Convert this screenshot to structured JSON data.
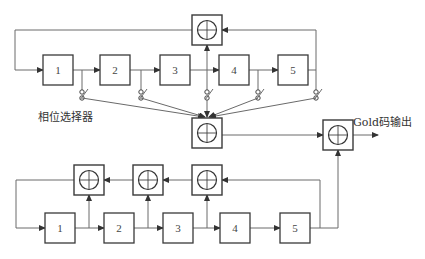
{
  "diagram": {
    "labels": {
      "phase_selector": "相位选择器",
      "output": "Gold码输出"
    },
    "xor_symbol": "⊕",
    "top_register": {
      "name": "m序列发生器1",
      "stages": [
        "1",
        "2",
        "3",
        "4",
        "5"
      ]
    },
    "bottom_register": {
      "name": "m序列发生器2",
      "stages": [
        "1",
        "2",
        "3",
        "4",
        "5"
      ]
    },
    "colors": {
      "line": "#6a6a6a",
      "box_border": "#3a3a3a",
      "text": "#333333",
      "background": "#ffffff"
    }
  }
}
